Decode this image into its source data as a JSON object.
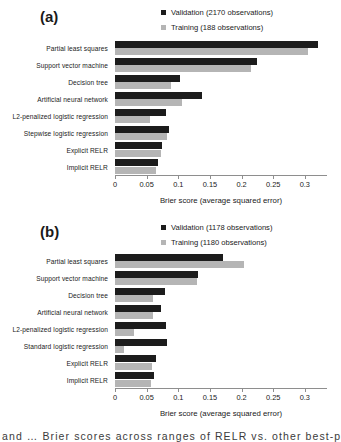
{
  "figure": {
    "axis_title": "Brier score (average squared error)",
    "caption_fragment": "and … Brier scores across ranges of RELR vs. other best-practice algorithms",
    "colors": {
      "validation": "#1c1c1c",
      "training": "#b5b5b5",
      "axis": "#8e8e8e"
    }
  },
  "panels": [
    {
      "label": "(a)",
      "legend": [
        {
          "name": "validation-legend",
          "swatch": "validation",
          "text": "Validation (2170 observations)"
        },
        {
          "name": "training-legend",
          "swatch": "training",
          "text": "Training (188 observations)"
        }
      ],
      "chart_data": {
        "type": "bar",
        "orientation": "horizontal",
        "title": "(a)",
        "xlabel": "Brier score (average squared error)",
        "ylabel": "",
        "xlim": [
          0,
          0.335
        ],
        "xticks": [
          0,
          0.05,
          0.1,
          0.15,
          0.2,
          0.25,
          0.3
        ],
        "xticklabels": [
          "0",
          "0.05",
          "0.1",
          "0.15",
          "0.2",
          "0.25",
          "0.3"
        ],
        "grid": false,
        "legend_position": "top-right",
        "categories": [
          "Partial least squares",
          "Support vector machine",
          "Decision tree",
          "Artificial neural network",
          "L2-penalized logistic regression",
          "Stepwise logistic regression",
          "Explicit RELR",
          "Implicit RELR"
        ],
        "series": [
          {
            "name": "Validation (2170 observations)",
            "color": "#1c1c1c",
            "values": [
              0.32,
              0.225,
              0.103,
              0.137,
              0.08,
              0.085,
              0.074,
              0.068
            ]
          },
          {
            "name": "Training (188 observations)",
            "color": "#b5b5b5",
            "values": [
              0.305,
              0.215,
              0.088,
              0.106,
              0.055,
              0.082,
              0.072,
              0.065
            ]
          }
        ]
      }
    },
    {
      "label": "(b)",
      "legend": [
        {
          "name": "validation-legend",
          "swatch": "validation",
          "text": "Validation (1178 observations)"
        },
        {
          "name": "training-legend",
          "swatch": "training",
          "text": "Training (1180 observations)"
        }
      ],
      "chart_data": {
        "type": "bar",
        "orientation": "horizontal",
        "title": "(b)",
        "xlabel": "Brier score (average squared error)",
        "ylabel": "",
        "xlim": [
          0,
          0.335
        ],
        "xticks": [
          0,
          0.05,
          0.1,
          0.15,
          0.2,
          0.25,
          0.3
        ],
        "xticklabels": [
          "0",
          "0.05",
          "0.1",
          "0.15",
          "0.2",
          "0.25",
          "0.3"
        ],
        "grid": false,
        "legend_position": "top-right",
        "categories": [
          "Partial least squares",
          "Support vector machine",
          "Decision tree",
          "Artificial neural network",
          "L2-penalized logistic regression",
          "Standard logistic regression",
          "Explicit RELR",
          "Implicit RELR"
        ],
        "series": [
          {
            "name": "Validation (1178 observations)",
            "color": "#1c1c1c",
            "values": [
              0.17,
              0.131,
              0.079,
              0.073,
              0.081,
              0.082,
              0.065,
              0.062
            ]
          },
          {
            "name": "Training (1180 observations)",
            "color": "#b5b5b5",
            "values": [
              0.204,
              0.13,
              0.06,
              0.06,
              0.03,
              0.015,
              0.058,
              0.057
            ]
          }
        ]
      }
    }
  ]
}
